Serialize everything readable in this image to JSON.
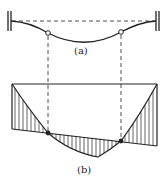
{
  "figure": {
    "part_a": {
      "label": "(a)",
      "description": "fixed-fixed beam deflected shape with two hinge (inflection) points",
      "supports": [
        "fixed-left",
        "fixed-right"
      ],
      "hinges": 2
    },
    "part_b": {
      "label": "(b)",
      "description": "moment diagram: parabolic curve superimposed on sloped straight line, hatched regions, inflection points marked"
    }
  },
  "colors": {
    "line": "#222222",
    "background": "#ffffff"
  }
}
